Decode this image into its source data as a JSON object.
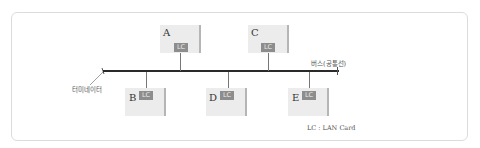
{
  "diagram": {
    "type": "bus-topology",
    "bus_label": "버스(공통선)",
    "terminator_label": "터미네이터",
    "legend": "LC : LAN Card",
    "nodes": [
      {
        "id": "A",
        "label": "A",
        "card": "LC",
        "side": "top"
      },
      {
        "id": "C",
        "label": "C",
        "card": "LC",
        "side": "top"
      },
      {
        "id": "B",
        "label": "B",
        "card": "LC",
        "side": "bottom"
      },
      {
        "id": "D",
        "label": "D",
        "card": "LC",
        "side": "bottom"
      },
      {
        "id": "E",
        "label": "E",
        "card": "LC",
        "side": "bottom"
      }
    ]
  }
}
